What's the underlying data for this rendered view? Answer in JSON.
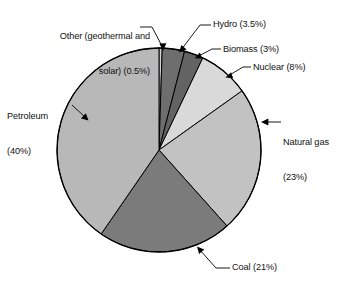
{
  "chart_data": {
    "type": "pie",
    "title": "",
    "subtitle": "",
    "xlabel": "",
    "ylabel": "",
    "legend_position": "none",
    "grid": false,
    "start_angle_deg": 0,
    "direction": "clockwise",
    "units": "percent",
    "total": 99.0,
    "categories": [
      "Other (geothermal and solar)",
      "Hydro",
      "Biomass",
      "Nuclear",
      "Natural gas",
      "Coal",
      "Petroleum"
    ],
    "values": [
      0.5,
      3.5,
      3,
      8,
      23,
      21,
      40
    ],
    "slices": [
      {
        "name": "Other (geothermal and solar)",
        "value": 0.5,
        "color": "#d4d4d4"
      },
      {
        "name": "Hydro",
        "value": 3.5,
        "color": "#6e6e6e"
      },
      {
        "name": "Biomass",
        "value": 3,
        "color": "#636363"
      },
      {
        "name": "Nuclear",
        "value": 8,
        "color": "#d9d9d9"
      },
      {
        "name": "Natural gas",
        "value": 23,
        "color": "#c2c2c2"
      },
      {
        "name": "Coal",
        "value": 21,
        "color": "#7b7b7b"
      },
      {
        "name": "Petroleum",
        "value": 40,
        "color": "#b8b8b8"
      }
    ],
    "annotations": [
      {
        "id": "other",
        "text_line1": "Other (geothermal and",
        "text_line2": "solar) (0.5%)",
        "align": "right"
      },
      {
        "id": "hydro",
        "text_line1": "Hydro (3.5%)",
        "text_line2": "",
        "align": "left"
      },
      {
        "id": "biomass",
        "text_line1": "Biomass (3%)",
        "text_line2": "",
        "align": "left"
      },
      {
        "id": "nuclear",
        "text_line1": "Nuclear (8%)",
        "text_line2": "",
        "align": "left"
      },
      {
        "id": "natgas",
        "text_line1": "Natural gas",
        "text_line2": "(23%)",
        "align": "left"
      },
      {
        "id": "petroleum",
        "text_line1": "Petroleum",
        "text_line2": "(40%)",
        "align": "left"
      },
      {
        "id": "coal",
        "text_line1": "Coal (21%)",
        "text_line2": "",
        "align": "left"
      }
    ]
  },
  "labels": {
    "other_line1": "Other (geothermal and",
    "other_line2": "solar) (0.5%)",
    "hydro": "Hydro (3.5%)",
    "biomass": "Biomass (3%)",
    "nuclear": "Nuclear (8%)",
    "natgas_line1": "Natural gas",
    "natgas_line2": "(23%)",
    "petroleum_line1": "Petroleum",
    "petroleum_line2": "(40%)",
    "coal": "Coal (21%)"
  },
  "colors": {
    "background": "#ffffff",
    "outline": "#000000",
    "text": "#111111",
    "leader": "#000000"
  }
}
